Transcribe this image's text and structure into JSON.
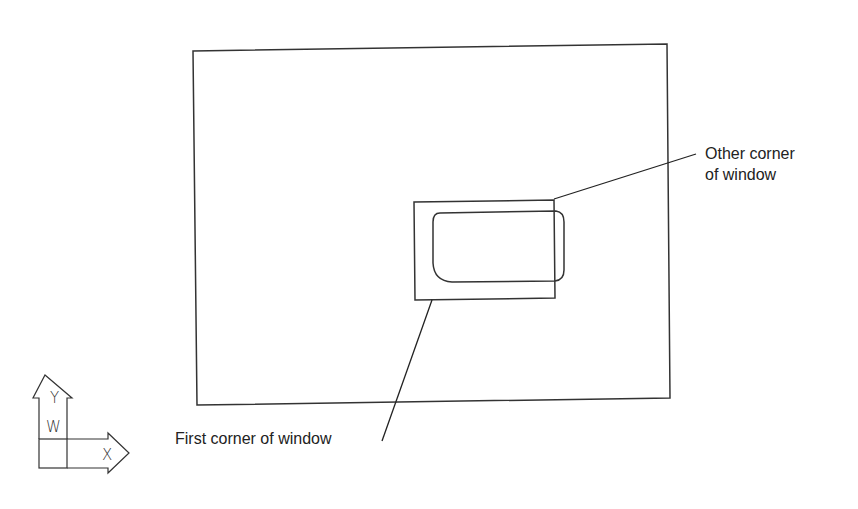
{
  "diagram": {
    "title": "",
    "stroke_color": "#333333",
    "background": "#ffffff",
    "labels": {
      "other_corner_line1": "Other corner",
      "other_corner_line2": "of window",
      "first_corner": "First corner of window"
    },
    "ucs_icon": {
      "y_axis_letter": "Y",
      "x_axis_letter": "X",
      "world_letter": "W"
    }
  }
}
